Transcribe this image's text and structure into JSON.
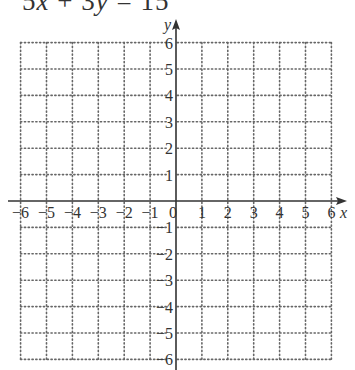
{
  "equation": {
    "text": "5x + 3y = 15",
    "parts": [
      "5",
      "x",
      " + 3",
      "y",
      " = 15"
    ]
  },
  "graph": {
    "x_axis_label": "x",
    "y_axis_label": "y",
    "x_range": [
      -6,
      6
    ],
    "y_range": [
      -6,
      6
    ],
    "grid": "dotted",
    "x_tick_labels": [
      "−6",
      "−5",
      "−4",
      "−3",
      "−2",
      "−1",
      "0",
      "1",
      "2",
      "3",
      "4",
      "5",
      "6"
    ],
    "y_tick_labels_positive": [
      "1",
      "2",
      "3",
      "4",
      "5",
      "6"
    ],
    "y_tick_labels_negative": [
      "−1",
      "−2",
      "−3",
      "−4",
      "−5",
      "−6"
    ],
    "colors": {
      "axis": "#333333",
      "grid": "#666666",
      "text": "#333333"
    }
  }
}
